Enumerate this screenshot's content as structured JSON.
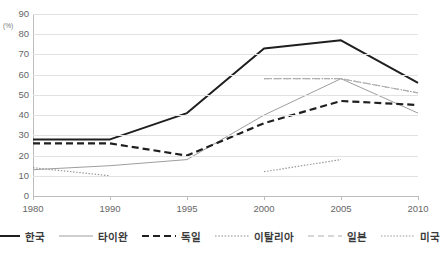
{
  "title_fragment": "",
  "axis": {
    "y_unit": "(%)",
    "y_ticks": [
      "90",
      "80",
      "70",
      "60",
      "50",
      "40",
      "30",
      "20",
      "10",
      "0"
    ],
    "x_ticks": [
      "1980",
      "1990",
      "1995",
      "2000",
      "2005",
      "2010"
    ]
  },
  "legend": {
    "items": [
      {
        "label": "한국",
        "style": "solid-thick-black",
        "color": "#1a1a1a"
      },
      {
        "label": "타이완",
        "style": "solid-thin-gray",
        "color": "#9a9a9a"
      },
      {
        "label": "독일",
        "style": "dashed-thick-black",
        "color": "#1a1a1a"
      },
      {
        "label": "이탈리아",
        "style": "dotted-thin-gray",
        "color": "#8f8f8f"
      },
      {
        "label": "일본",
        "style": "dashed-thin-gray",
        "color": "#b3b3b3"
      },
      {
        "label": "미국",
        "style": "dotted-thin-lightgray",
        "color": "#b8b8b8"
      }
    ]
  },
  "chart_data": {
    "type": "line",
    "title": "",
    "xlabel": "",
    "ylabel": "(%)",
    "x": [
      "1980",
      "1990",
      "1995",
      "2000",
      "2005",
      "2010"
    ],
    "ylim": [
      0,
      90
    ],
    "ytick_step": 10,
    "grid": true,
    "legend_position": "bottom",
    "series": [
      {
        "name": "한국",
        "values": [
          28,
          28,
          41,
          73,
          77,
          56
        ]
      },
      {
        "name": "타이완",
        "values": [
          13,
          15,
          18,
          40,
          58,
          41
        ]
      },
      {
        "name": "독일",
        "values": [
          26,
          26,
          20,
          36,
          47,
          45
        ]
      },
      {
        "name": "이탈리아",
        "values": [
          null,
          null,
          null,
          58,
          58,
          51
        ]
      },
      {
        "name": "일본",
        "values": [
          null,
          null,
          null,
          58,
          58,
          51
        ]
      },
      {
        "name": "미국",
        "values": [
          14,
          10,
          null,
          12,
          18,
          null
        ]
      }
    ]
  }
}
